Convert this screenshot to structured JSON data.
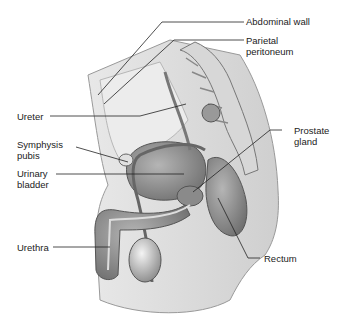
{
  "diagram": {
    "labels": {
      "abdominal_wall": "Abdominal wall",
      "parietal_peritoneum": "Parietal\nperitoneum",
      "ureter": "Ureter",
      "symphysis_pubis": "Symphysis\npubis",
      "urinary_bladder": "Urinary\nbladder",
      "urethra": "Urethra",
      "prostate_gland": "Prostate\ngland",
      "rectum": "Rectum"
    }
  }
}
